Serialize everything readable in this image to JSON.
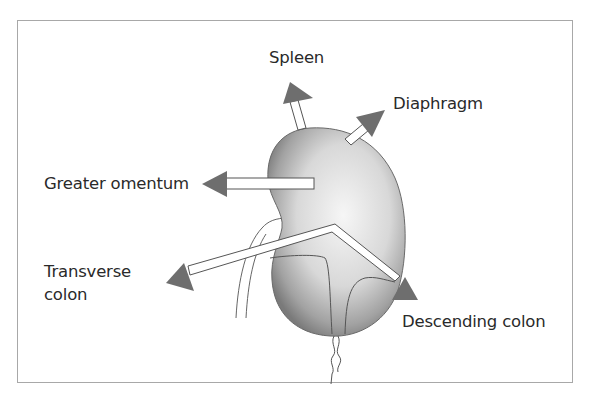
{
  "figure": {
    "subject": "spleen",
    "colors": {
      "frame": "#a8a8a8",
      "arrowhead": "#6e6e6e",
      "organ_light": "#f4f4f4",
      "organ_dark": "#7a7a7a",
      "outline": "#555555",
      "text": "#2a2a2a"
    }
  },
  "labels": {
    "spleen": "Spleen",
    "diaphragm": "Diaphragm",
    "greater_omentum": "Greater omentum",
    "transverse_colon_1": "Transverse",
    "transverse_colon_2": "colon",
    "descending_colon": "Descending colon"
  },
  "arrows": [
    {
      "name": "spleen",
      "direction": "up"
    },
    {
      "name": "diaphragm",
      "direction": "up-right"
    },
    {
      "name": "greater_omentum",
      "direction": "left"
    },
    {
      "name": "transverse_colon",
      "direction": "left-down"
    },
    {
      "name": "descending_colon",
      "direction": "right-down"
    }
  ]
}
